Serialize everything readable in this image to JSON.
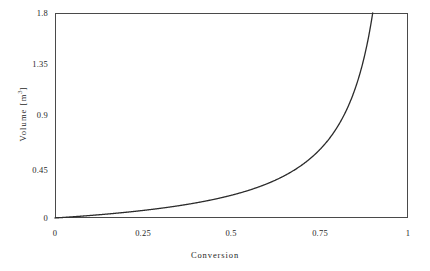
{
  "chart_data": {
    "type": "line",
    "title": "",
    "xlabel": "Conversion",
    "ylabel": "Volume [m³]",
    "ylabel_base": "Volume [m",
    "ylabel_exponent": "3",
    "ylabel_close": "]",
    "xlim": [
      0,
      1
    ],
    "ylim": [
      0,
      1.8
    ],
    "grid": false,
    "legend": null,
    "xticks": [
      "0",
      "0.25",
      "0.5",
      "0.75",
      "1"
    ],
    "xtick_values": [
      0,
      0.25,
      0.5,
      0.75,
      1
    ],
    "yticks": [
      "0",
      "0.45",
      "0.9",
      "1.35",
      "1.8"
    ],
    "ytick_values": [
      0,
      0.45,
      0.9,
      1.35,
      1.8
    ],
    "series": [
      {
        "name": "Volume",
        "relation": "V = 0.2 * X / (1 - X)",
        "x": [
          0,
          0.05,
          0.1,
          0.15,
          0.2,
          0.25,
          0.3,
          0.35,
          0.4,
          0.45,
          0.5,
          0.55,
          0.6,
          0.65,
          0.7,
          0.75,
          0.8,
          0.85,
          0.88,
          0.9,
          0.92,
          0.94,
          0.95,
          0.96,
          0.97,
          0.98,
          0.985,
          0.99,
          0.995,
          1.0
        ],
        "values": [
          0.0,
          0.011,
          0.022,
          0.035,
          0.05,
          0.067,
          0.086,
          0.108,
          0.133,
          0.164,
          0.2,
          0.244,
          0.3,
          0.371,
          0.467,
          0.6,
          0.8,
          1.133,
          1.467,
          1.8,
          1.8,
          1.8,
          1.8,
          1.8,
          1.8,
          1.8,
          1.8,
          1.8,
          1.8,
          1.8
        ]
      }
    ],
    "colors": {
      "curve": "#2b2b2b",
      "frame": "#4a4a4a",
      "background": "#ffffff",
      "text": "#1f1f1f"
    }
  }
}
